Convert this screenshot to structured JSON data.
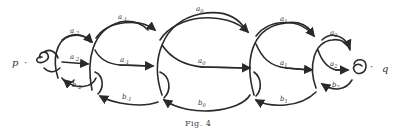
{
  "figure": {
    "caption": "Fig. 4",
    "endpoints": {
      "left": "p",
      "right": "q",
      "separator": "·"
    },
    "labels_top": [
      {
        "base": "a",
        "sub": "-2"
      },
      {
        "base": "a",
        "sub": "-1"
      },
      {
        "base": "a",
        "sub": "0"
      },
      {
        "base": "a",
        "sub": "1"
      },
      {
        "base": "a",
        "sub": "2"
      }
    ],
    "labels_middle": [
      {
        "base": "a",
        "sub": "-2"
      },
      {
        "base": "a",
        "sub": "-1"
      },
      {
        "base": "a",
        "sub": "0"
      },
      {
        "base": "a",
        "sub": "1"
      },
      {
        "base": "a",
        "sub": "2"
      }
    ],
    "labels_bottom": [
      {
        "base": "b",
        "sub": "-2"
      },
      {
        "base": "b",
        "sub": "-1"
      },
      {
        "base": "b",
        "sub": "0"
      },
      {
        "base": "b",
        "sub": "1"
      },
      {
        "base": "b",
        "sub": "2"
      }
    ],
    "stroke_color": "#2a2a2a"
  }
}
